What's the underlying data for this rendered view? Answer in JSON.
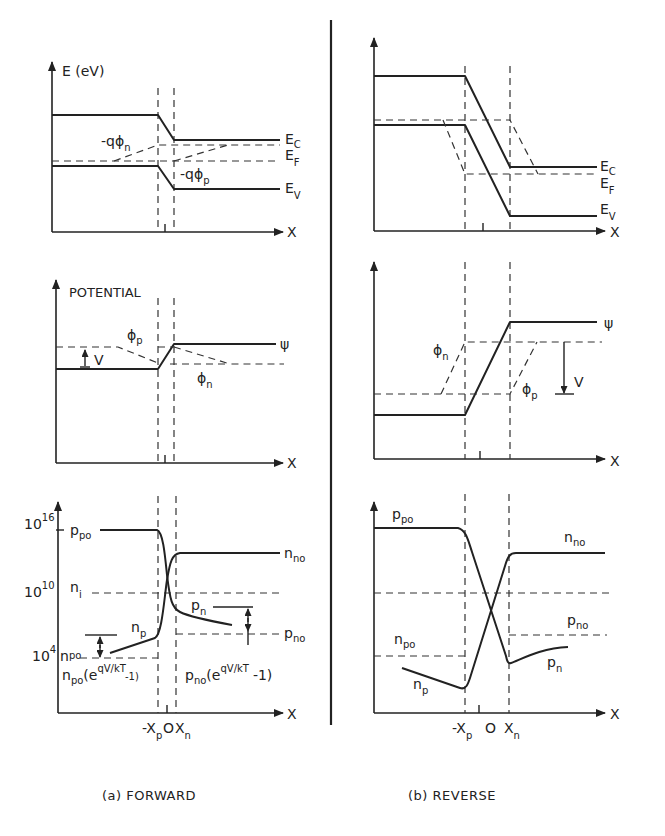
{
  "figure": {
    "divider_color": "#222222",
    "ink_color": "#222222",
    "background": "#ffffff"
  },
  "forward": {
    "caption": "(a)  FORWARD",
    "band": {
      "y_axis_label": "E (eV)",
      "x_axis_label": "X",
      "Ec": "E",
      "Ec_sub": "C",
      "Ef": "E",
      "Ef_sub": "F",
      "Ev": "E",
      "Ev_sub": "V",
      "phi_n_label": "-qϕ",
      "phi_n_sub": "n",
      "phi_p_label": "-qϕ",
      "phi_p_sub": "p"
    },
    "potential": {
      "y_axis_label": "POTENTIAL",
      "x_axis_label": "X",
      "psi": "ψ",
      "phi_p": "ϕ",
      "phi_p_sub": "p",
      "phi_n": "ϕ",
      "phi_n_sub": "n",
      "V": "V"
    },
    "carriers": {
      "x_axis_label": "X",
      "tick_16": "10",
      "tick_16_exp": "16",
      "tick_10": "10",
      "tick_10_exp": "10",
      "tick_4": "10",
      "tick_4_exp": "4",
      "ppo": "p",
      "ppo_sub": "po",
      "nno": "n",
      "nno_sub": "no",
      "ni": "n",
      "ni_sub": "i",
      "pn": "p",
      "pn_sub": "n",
      "np": "n",
      "np_sub": "p",
      "pno": "p",
      "pno_sub": "no",
      "npo": "n",
      "npo_sub": "po",
      "np_excess": "n",
      "np_excess_sub": "po",
      "np_excess_expr": "(e",
      "np_excess_sup": "qV/kT",
      "np_excess_tail": "-1)",
      "pn_excess": "p",
      "pn_excess_sub": "no",
      "pn_excess_expr": "(e",
      "pn_excess_sup": "qV/kT",
      "pn_excess_tail": "-1)",
      "x_tick_neg_xp": "-X",
      "x_tick_neg_xp_sub": "p",
      "x_tick_zero": "O",
      "x_tick_xn": "X",
      "x_tick_xn_sub": "n"
    }
  },
  "reverse": {
    "caption": "(b)  REVERSE",
    "band": {
      "x_axis_label": "X",
      "Ec": "E",
      "Ec_sub": "C",
      "Ef": "E",
      "Ef_sub": "F",
      "Ev": "E",
      "Ev_sub": "V"
    },
    "potential": {
      "x_axis_label": "X",
      "psi": "ψ",
      "phi_n": "ϕ",
      "phi_n_sub": "n",
      "phi_p": "ϕ",
      "phi_p_sub": "p",
      "V": "V"
    },
    "carriers": {
      "x_axis_label": "X",
      "ppo": "p",
      "ppo_sub": "po",
      "nno": "n",
      "nno_sub": "no",
      "pno": "p",
      "pno_sub": "no",
      "npo": "n",
      "npo_sub": "po",
      "pn": "p",
      "pn_sub": "n",
      "np": "n",
      "np_sub": "p",
      "x_tick_neg_xp": "-X",
      "x_tick_neg_xp_sub": "p",
      "x_tick_zero": "O",
      "x_tick_xn": "X",
      "x_tick_xn_sub": "n"
    }
  }
}
